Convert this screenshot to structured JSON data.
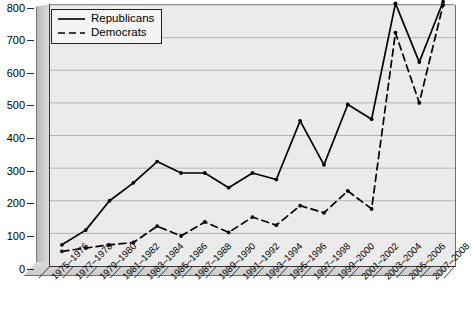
{
  "chart_data": {
    "type": "line",
    "title": "",
    "subtitle": "",
    "xlabel": "",
    "ylabel": "",
    "categories": [
      "1975–1976",
      "1977–1978",
      "1979–1980",
      "1981–1982",
      "1983–1984",
      "1985–1986",
      "1987–1988",
      "1989–1990",
      "1991–1992",
      "1993–1994",
      "1995–1996",
      "1997–1998",
      "1999–2000",
      "2001–2002",
      "2003–2004",
      "2005–2006",
      "2007–2008"
    ],
    "series": [
      {
        "name": "Republicans",
        "style": "solid",
        "color": "#000000",
        "values": [
          65,
          110,
          200,
          255,
          320,
          285,
          285,
          240,
          285,
          265,
          445,
          310,
          495,
          450,
          805,
          625,
          810
        ]
      },
      {
        "name": "Democrats",
        "style": "dashed",
        "color": "#000000",
        "values": [
          45,
          55,
          65,
          72,
          122,
          92,
          135,
          103,
          150,
          125,
          185,
          163,
          230,
          175,
          715,
          500,
          800
        ]
      }
    ],
    "ylim": [
      0,
      800
    ],
    "yticks": [
      0,
      100,
      200,
      300,
      400,
      500,
      600,
      700,
      800
    ],
    "ytick_labels": [
      "0",
      "100",
      "200",
      "300",
      "400",
      "500",
      "600",
      "700",
      "800"
    ],
    "grid": true,
    "grid_axis": "y",
    "legend_position": "top-left",
    "markers": true,
    "three_d_walls": true
  },
  "legend": {
    "items": [
      {
        "label": "Republicans",
        "key": "solid-line-key"
      },
      {
        "label": "Democrats",
        "key": "dashed-line-key"
      }
    ]
  },
  "colors": {
    "plot_background": "#ebebeb",
    "gridline": "#b4b4b4",
    "axis": "#2b2b2b",
    "wall": "#cfcfcf",
    "series": "#000000",
    "page_background": "#ffffff"
  }
}
